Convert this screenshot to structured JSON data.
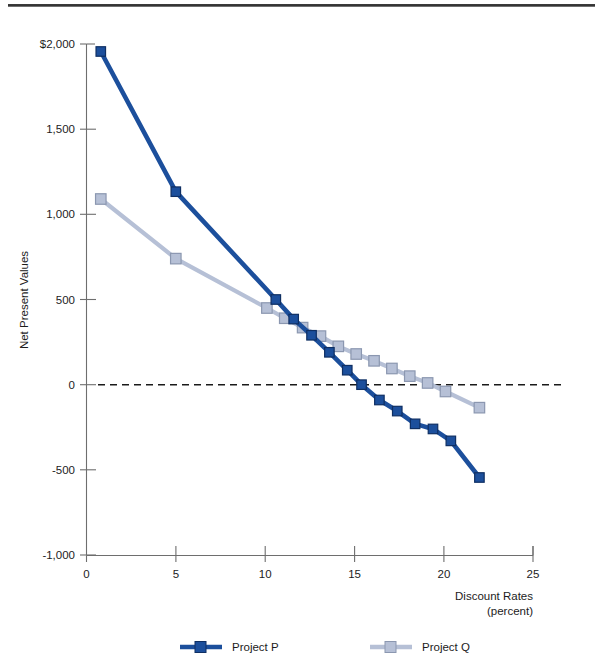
{
  "figure": {
    "title": "",
    "top_rule": "decorative-rule"
  },
  "chart_data": {
    "type": "line",
    "title": "",
    "xlabel": "Discount Rates",
    "xlabel_sub": "(percent)",
    "ylabel": "Net Present Values",
    "xlim": [
      0,
      25
    ],
    "ylim": [
      -1000,
      2000
    ],
    "xticks": [
      0,
      5,
      10,
      15,
      20,
      25
    ],
    "xtick_labels": [
      "0",
      "5",
      "10",
      "15",
      "20",
      "25"
    ],
    "yticks": [
      -1000,
      -500,
      0,
      500,
      1000,
      1500,
      2000
    ],
    "ytick_labels": [
      "-1,000",
      "-500",
      "0",
      "500",
      "1,000",
      "1,500",
      "$2,000"
    ],
    "grid": false,
    "zero_line": true,
    "zero_line_style": "dashed",
    "legend_position": "bottom",
    "series": [
      {
        "name": "Project P",
        "color": "#1c4f9c",
        "marker": "square",
        "x": [
          0.8,
          5,
          10.6,
          11.6,
          12.6,
          13.6,
          14.6,
          15.4,
          16.4,
          17.4,
          18.4,
          19.4,
          20.4,
          22.0
        ],
        "y": [
          1956,
          1133,
          500,
          385,
          290,
          190,
          85,
          0,
          -90,
          -155,
          -230,
          -260,
          -330,
          -545
        ]
      },
      {
        "name": "Project Q",
        "color": "#b6c0d6",
        "marker": "square",
        "x": [
          0.8,
          5,
          10.1,
          11.1,
          12.1,
          13.1,
          14.1,
          15.1,
          16.1,
          17.1,
          18.1,
          19.1,
          20.1,
          22.0
        ],
        "y": [
          1090,
          740,
          450,
          390,
          335,
          285,
          225,
          180,
          140,
          95,
          50,
          10,
          -40,
          -135
        ]
      }
    ]
  },
  "legend": {
    "entries": [
      {
        "label": "Project P",
        "color": "#1c4f9c"
      },
      {
        "label": "Project Q",
        "color": "#b6c0d6"
      }
    ]
  }
}
